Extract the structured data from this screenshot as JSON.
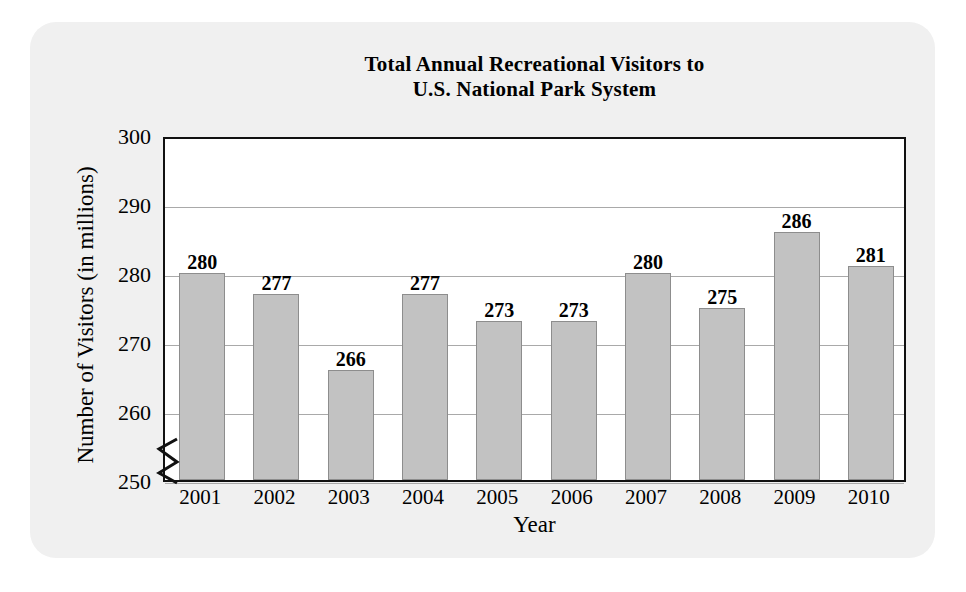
{
  "figure": {
    "panel_background": "#f0f0f0",
    "plot_background": "#ffffff",
    "bar_color": "#c2c2c2",
    "bar_border_color": "#8d8d8d",
    "gridline_color": "#a9a9a9",
    "axis_color": "#111111"
  },
  "chart_data": {
    "type": "bar",
    "title": "Total Annual Recreational Visitors to U.S. National Park System",
    "title_lines": [
      "Total Annual Recreational Visitors to",
      "U.S. National Park System"
    ],
    "xlabel": "Year",
    "ylabel": "Number of Visitors (in millions)",
    "categories": [
      "2001",
      "2002",
      "2003",
      "2004",
      "2005",
      "2006",
      "2007",
      "2008",
      "2009",
      "2010"
    ],
    "values": [
      280,
      277,
      266,
      277,
      273,
      273,
      280,
      275,
      286,
      281
    ],
    "value_labels": [
      "280",
      "277",
      "266",
      "277",
      "273",
      "273",
      "280",
      "275",
      "286",
      "281"
    ],
    "ylim": [
      250,
      300
    ],
    "ytick_values": [
      250,
      260,
      270,
      280,
      290,
      300
    ],
    "ytick_labels": [
      "250",
      "260",
      "270",
      "280",
      "290",
      "300"
    ],
    "ytick_step": 10,
    "grid": true,
    "grid_axis": "y",
    "legend": false,
    "axis_break": true,
    "axis_break_note": "y-axis broken below 250"
  }
}
